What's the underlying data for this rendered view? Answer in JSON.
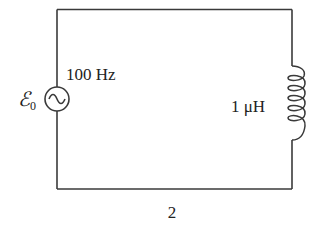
{
  "diagram": {
    "type": "circuit",
    "source": {
      "symbol": "ac-voltage-source",
      "emf_label": "ℰ",
      "emf_subscript": "0",
      "frequency_label": "100 Hz"
    },
    "inductor": {
      "symbol": "inductor-coil",
      "value_label": "1 μH"
    },
    "caption": "2",
    "colors": {
      "wire": "#3a3a3a",
      "text": "#222222",
      "background": "#ffffff"
    }
  }
}
